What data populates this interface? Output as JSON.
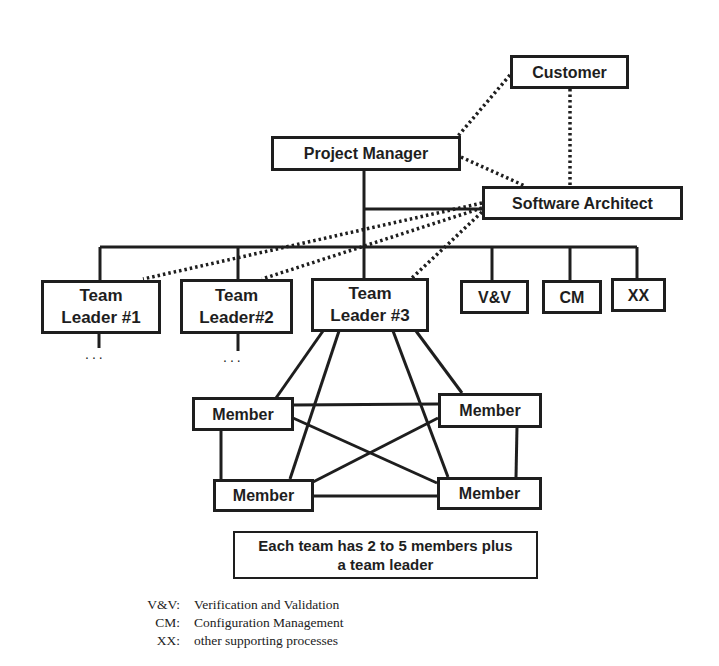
{
  "diagram": {
    "type": "organization-chart",
    "nodes": {
      "customer": "Customer",
      "project_manager": "Project Manager",
      "software_architect": "Software Architect",
      "team_leader_1": {
        "line1": "Team",
        "line2": "Leader #1"
      },
      "team_leader_2": {
        "line1": "Team",
        "line2": "Leader#2"
      },
      "team_leader_3": {
        "line1": "Team",
        "line2": "Leader #3"
      },
      "vv": "V&V",
      "cm": "CM",
      "xx": "XX",
      "members": [
        "Member",
        "Member",
        "Member",
        "Member"
      ]
    },
    "ellipsis": "...",
    "note": {
      "line1": "Each team has 2 to 5 members plus",
      "line2": "a team leader"
    },
    "legend": [
      {
        "key": "V&V:",
        "value": "Verification and Validation"
      },
      {
        "key": "CM:",
        "value": "Configuration Management"
      },
      {
        "key": "XX:",
        "value": "other supporting processes"
      }
    ],
    "edges": {
      "solid": [
        [
          "project_manager",
          "software_architect"
        ],
        [
          "project_manager",
          "team_leader_1"
        ],
        [
          "project_manager",
          "team_leader_2"
        ],
        [
          "project_manager",
          "team_leader_3"
        ],
        [
          "project_manager",
          "vv"
        ],
        [
          "project_manager",
          "cm"
        ],
        [
          "project_manager",
          "xx"
        ],
        [
          "team_leader_3",
          "member_top_left"
        ],
        [
          "team_leader_3",
          "member_top_right"
        ],
        [
          "team_leader_3",
          "member_bottom_left"
        ],
        [
          "team_leader_3",
          "member_bottom_right"
        ],
        [
          "member_top_left",
          "member_top_right"
        ],
        [
          "member_top_left",
          "member_bottom_left"
        ],
        [
          "member_top_left",
          "member_bottom_right"
        ],
        [
          "member_top_right",
          "member_bottom_left"
        ],
        [
          "member_top_right",
          "member_bottom_right"
        ],
        [
          "member_bottom_left",
          "member_bottom_right"
        ]
      ],
      "dotted": [
        [
          "customer",
          "project_manager"
        ],
        [
          "customer",
          "software_architect"
        ],
        [
          "project_manager",
          "software_architect"
        ],
        [
          "software_architect",
          "team_leader_1"
        ],
        [
          "software_architect",
          "team_leader_2"
        ],
        [
          "software_architect",
          "team_leader_3"
        ]
      ]
    },
    "colors": {
      "ink": "#1e1e1e",
      "background": "#ffffff"
    }
  }
}
